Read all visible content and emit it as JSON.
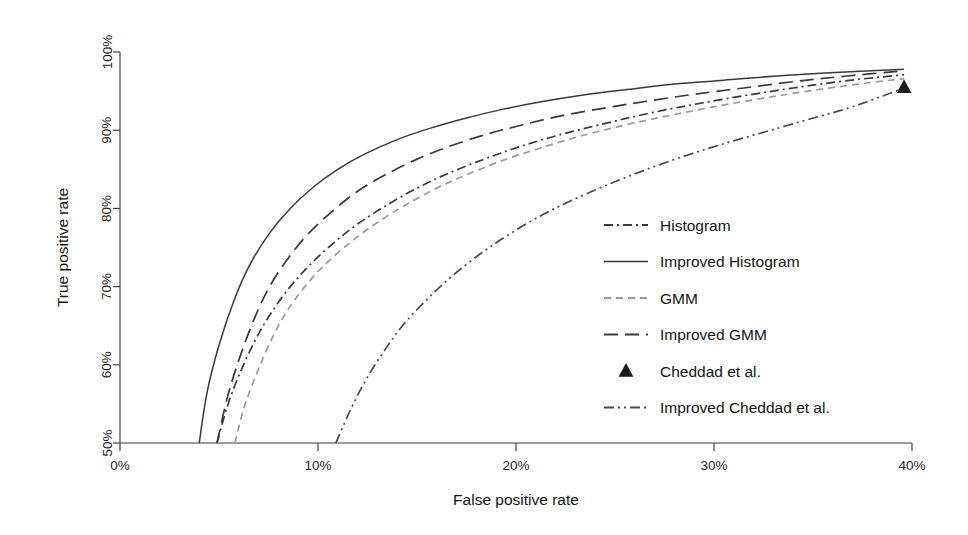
{
  "chart_data": {
    "type": "line",
    "title": "",
    "xlabel": "False positive rate",
    "ylabel": "True positive rate",
    "xlim": [
      0,
      40
    ],
    "ylim": [
      50,
      100
    ],
    "grid": false,
    "legend_position": "center-right",
    "xticks": [
      "0%",
      "10%",
      "20%",
      "30%",
      "40%"
    ],
    "xtick_values": [
      0,
      10,
      20,
      30,
      40
    ],
    "yticks": [
      "50%",
      "60%",
      "70%",
      "80%",
      "90%",
      "100%"
    ],
    "ytick_values": [
      50,
      60,
      70,
      80,
      90,
      100
    ],
    "series": [
      {
        "name": "Histogram",
        "style": "dashdot",
        "color": "#3a3a3a",
        "x": [
          4.9,
          5.4,
          6.0,
          6.8,
          7.6,
          8.6,
          9.6,
          10.8,
          12.0,
          13.4,
          15.0,
          16.6,
          18.4,
          20.2,
          22.2,
          24.4,
          26.6,
          29.0,
          31.5,
          34.0,
          36.6,
          39.6
        ],
        "y": [
          50.0,
          54.5,
          58.6,
          63.0,
          66.5,
          70.0,
          72.8,
          75.6,
          78.0,
          80.3,
          82.6,
          84.5,
          86.3,
          87.9,
          89.4,
          90.8,
          92.1,
          93.3,
          94.4,
          95.4,
          96.3,
          97.1
        ]
      },
      {
        "name": "Improved Histogram",
        "style": "solid",
        "color": "#3a3a3a",
        "x": [
          4.0,
          4.4,
          5.0,
          5.8,
          6.6,
          7.6,
          8.6,
          9.8,
          11.0,
          12.4,
          14.0,
          15.6,
          17.4,
          19.2,
          21.2,
          23.4,
          25.6,
          28.0,
          30.5,
          33.0,
          35.6,
          39.6
        ],
        "y": [
          50.0,
          56.5,
          62.5,
          68.5,
          73.0,
          77.0,
          80.0,
          82.8,
          85.0,
          87.0,
          88.8,
          90.2,
          91.5,
          92.6,
          93.6,
          94.5,
          95.2,
          95.9,
          96.4,
          96.9,
          97.3,
          97.8
        ]
      },
      {
        "name": "GMM",
        "style": "shortdash",
        "color": "#9a9a9a",
        "x": [
          5.8,
          6.3,
          7.0,
          7.8,
          8.6,
          9.6,
          10.6,
          11.8,
          13.0,
          14.4,
          16.0,
          17.6,
          19.4,
          21.2,
          23.2,
          25.4,
          27.6,
          30.0,
          32.5,
          35.0,
          37.6,
          39.6
        ],
        "y": [
          50.0,
          54.8,
          59.5,
          64.0,
          67.5,
          70.8,
          73.4,
          76.0,
          78.2,
          80.4,
          82.6,
          84.4,
          86.2,
          87.7,
          89.2,
          90.6,
          91.8,
          93.0,
          94.1,
          95.1,
          96.0,
          96.6
        ]
      },
      {
        "name": "Improved GMM",
        "style": "longdash",
        "color": "#3a3a3a",
        "x": [
          4.9,
          5.4,
          6.0,
          6.8,
          7.6,
          8.6,
          9.6,
          10.8,
          12.0,
          13.4,
          15.0,
          16.6,
          18.4,
          20.2,
          22.2,
          24.4,
          26.6,
          29.0,
          31.5,
          34.0,
          36.6,
          39.6
        ],
        "y": [
          50.0,
          55.6,
          60.6,
          66.0,
          70.2,
          74.0,
          77.0,
          79.8,
          82.2,
          84.3,
          86.3,
          87.9,
          89.4,
          90.6,
          91.8,
          92.8,
          93.7,
          94.6,
          95.4,
          96.2,
          96.9,
          97.6
        ]
      },
      {
        "name": "Improved Cheddad et al.",
        "style": "dashdotdot",
        "color": "#4a4a4a",
        "x": [
          10.9,
          11.6,
          12.4,
          13.4,
          14.4,
          15.6,
          16.8,
          18.2,
          19.6,
          21.2,
          22.8,
          24.6,
          26.4,
          28.4,
          30.4,
          32.6,
          34.8,
          37.0,
          39.6
        ],
        "y": [
          50.0,
          54.0,
          58.0,
          62.0,
          65.4,
          68.6,
          71.4,
          74.2,
          76.6,
          79.0,
          81.0,
          83.0,
          84.8,
          86.6,
          88.2,
          89.8,
          91.4,
          93.0,
          95.4
        ]
      }
    ],
    "points": [
      {
        "name": "Cheddad et al.",
        "style": "triangle",
        "color": "#1a1a1a",
        "x": 39.6,
        "y": 95.5
      }
    ]
  },
  "legend": {
    "entries": [
      {
        "label": "Histogram",
        "style": "dashdot",
        "color": "#3a3a3a"
      },
      {
        "label": "Improved Histogram",
        "style": "solid",
        "color": "#3a3a3a"
      },
      {
        "label": "GMM",
        "style": "shortdash",
        "color": "#9a9a9a"
      },
      {
        "label": "Improved GMM",
        "style": "longdash",
        "color": "#3a3a3a"
      },
      {
        "label": "Cheddad et al.",
        "style": "triangle",
        "color": "#1a1a1a"
      },
      {
        "label": "Improved Cheddad et al.",
        "style": "dashdotdot",
        "color": "#4a4a4a"
      }
    ]
  }
}
